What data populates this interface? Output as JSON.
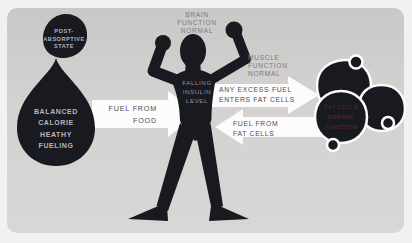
{
  "title": "Post-absorptive state fuel-flow diagram",
  "colors": {
    "page_bg": "#f2f1ef",
    "card_bg": "#d3d2d0",
    "shape_dark": "#191920",
    "arrow_white": "#fcfcfc",
    "muted_label": "#7b7b7f",
    "arrow_text": "#4c4c52",
    "on_dark_text": "#b6b6bc",
    "insulin_text": "#90909a",
    "fat_cells_text": "#4e2429"
  },
  "labels": {
    "state_badge": "POST-\nABSORPTIVE\nSTATE",
    "droplet": "BALANCED\nCALORIE\nHEATHY\nFUELING",
    "brain": "BRAIN\nFUNCTION\nNORMAL",
    "muscle": "MUSCLE\nFUNCTION\nNORMAL",
    "insulin": "FALLING\nINSULIN\nLEVEL",
    "arrow_fuel_from_food": "FUEL FROM\nFOOD",
    "arrow_excess_fuel": "ANY EXCESS FUEL\nENTERS FAT CELLS",
    "arrow_fuel_from_fat": "FUEL FROM\nFAT CELLS",
    "fat_cells": "FAT CELLS\nNORMAL\nFUNCTION"
  }
}
